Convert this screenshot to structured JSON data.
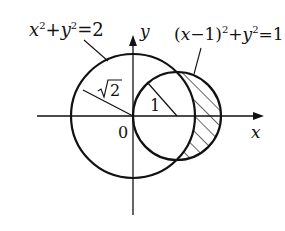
{
  "diagram": {
    "type": "geometry",
    "axes": {
      "x_label": "x",
      "y_label": "y",
      "origin_label": "0"
    },
    "circles": [
      {
        "equation_lhs_a": "x",
        "sup_a": "2",
        "plus": "+",
        "equation_lhs_b": "y",
        "sup_b": "2",
        "equation_rhs": "=2",
        "center": [
          0,
          0
        ],
        "radius_label": "√2",
        "radius_radical": "2"
      },
      {
        "equation_prefix": "(",
        "var": "x",
        "minus_one": "−1)",
        "sup_a": "2",
        "plus": "+",
        "var_b": "y",
        "sup_b": "2",
        "equation_rhs": "=1",
        "center": [
          1,
          0
        ],
        "radius_label": "1"
      }
    ],
    "shaded_region": "inside (x−1)²+y²=1 and outside x²+y²=2 (hatched)",
    "colors": {
      "stroke": "#111111",
      "background": "#ffffff"
    }
  }
}
